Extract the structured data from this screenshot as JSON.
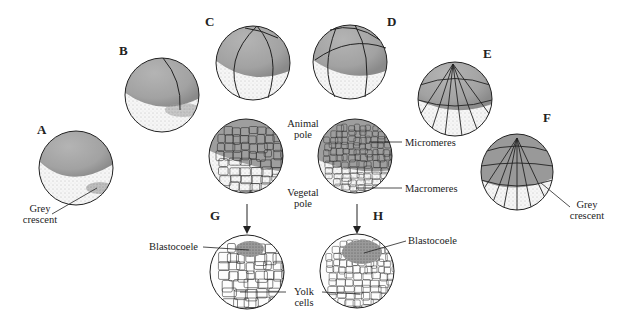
{
  "figure": {
    "panels": [
      {
        "id": "A",
        "letter": "A",
        "description": "Fertilized egg showing grey crescent"
      },
      {
        "id": "B",
        "letter": "B",
        "description": "2-cell stage"
      },
      {
        "id": "C",
        "letter": "C",
        "description": "4-cell stage"
      },
      {
        "id": "D",
        "letter": "D",
        "description": "8-cell stage"
      },
      {
        "id": "E",
        "letter": "E",
        "description": "16-cell stage"
      },
      {
        "id": "F",
        "letter": "F",
        "description": "32-cell stage"
      },
      {
        "id": "G",
        "letter": "G",
        "description": "Blastula section"
      },
      {
        "id": "H",
        "letter": "H",
        "description": "Later blastula section"
      }
    ],
    "labels": {
      "grey_crescent_a_line1": "Grey",
      "grey_crescent_a_line2": "crescent",
      "grey_crescent_f_line1": "Grey",
      "grey_crescent_f_line2": "crescent",
      "animal_pole_line1": "Animal",
      "animal_pole_line2": "pole",
      "vegetal_pole_line1": "Vegetal",
      "vegetal_pole_line2": "pole",
      "micromeres": "Micromeres",
      "macromeres": "Macromeres",
      "blastocoele_g": "Blastocoele",
      "blastocoele_h": "Blastocoele",
      "yolk_line1": "Yolk",
      "yolk_line2": "cells"
    },
    "colors": {
      "animal_hemisphere": "#a9a9a9",
      "vegetal_hemisphere": "#f4f4f4",
      "outline": "#222222"
    }
  }
}
